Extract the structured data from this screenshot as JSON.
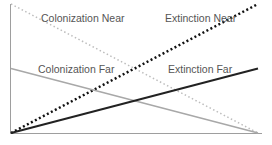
{
  "chart_data": {
    "type": "line",
    "title": "",
    "xlabel": "",
    "ylabel": "",
    "grid": false,
    "legend": "inline labels",
    "x": [
      0,
      1
    ],
    "xlim": [
      0,
      1
    ],
    "ylim": [
      0,
      1
    ],
    "series": [
      {
        "name": "Colonization Near",
        "values": [
          1.0,
          0.0
        ],
        "style": "dotted",
        "color": "#bdbdbd",
        "width": 1.5
      },
      {
        "name": "Extinction Near",
        "values": [
          0.0,
          1.0
        ],
        "style": "dotted",
        "color": "#111111",
        "width": 2.5
      },
      {
        "name": "Colonization Far",
        "values": [
          0.5,
          0.0
        ],
        "style": "solid",
        "color": "#a8a8a8",
        "width": 1.5
      },
      {
        "name": "Extinction Far",
        "values": [
          0.0,
          0.5
        ],
        "style": "solid",
        "color": "#222222",
        "width": 2
      }
    ],
    "annotations": [
      {
        "text": "Colonization Near",
        "x": 41,
        "y": 12
      },
      {
        "text": "Extinction Near",
        "x": 165,
        "y": 12
      },
      {
        "text": "Colonization Far",
        "x": 38,
        "y": 63
      },
      {
        "text": "Extinction Far",
        "x": 168,
        "y": 63
      }
    ]
  }
}
